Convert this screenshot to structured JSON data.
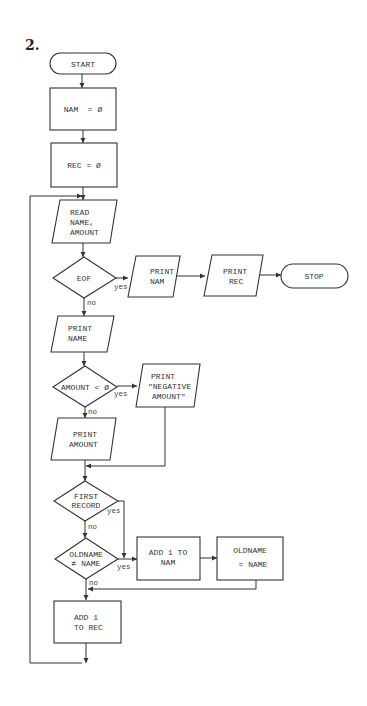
{
  "figure": {
    "number_label": "2."
  },
  "nodes": {
    "start": {
      "type": "terminal",
      "label": "START"
    },
    "init_nam": {
      "type": "process",
      "label": "NAM  = Ø"
    },
    "init_rec": {
      "type": "process",
      "label": "REC = Ø"
    },
    "read": {
      "type": "io",
      "lines": [
        "READ",
        "NAME,",
        "AMOUNT"
      ]
    },
    "eof": {
      "type": "decision",
      "label": "EOF"
    },
    "print_nam": {
      "type": "io",
      "lines": [
        "PRINT",
        "NAM"
      ]
    },
    "print_rec": {
      "type": "io",
      "lines": [
        "PRINT",
        "REC"
      ]
    },
    "stop": {
      "type": "terminal",
      "label": "STOP"
    },
    "print_name": {
      "type": "io",
      "lines": [
        "PRINT",
        "NAME"
      ]
    },
    "amount_neg": {
      "type": "decision",
      "label": "AMOUNT < Ø"
    },
    "print_negative": {
      "type": "io",
      "lines": [
        "PRINT",
        "\"NEGATIVE",
        "AMOUNT\""
      ]
    },
    "print_amount": {
      "type": "io",
      "lines": [
        "PRINT",
        "AMOUNT"
      ]
    },
    "first_record": {
      "type": "decision",
      "lines": [
        "FIRST",
        "RECORD"
      ]
    },
    "oldname_ne": {
      "type": "decision",
      "lines": [
        "OLDNAME",
        "≠ NAME"
      ]
    },
    "add_nam": {
      "type": "process",
      "lines": [
        "ADD 1 TO",
        "NAM"
      ]
    },
    "set_oldname": {
      "type": "process",
      "lines": [
        "OLDNAME",
        "= NAME"
      ]
    },
    "add_rec": {
      "type": "process",
      "lines": [
        "ADD 1",
        "TO REC"
      ]
    }
  },
  "edge_labels": {
    "eof_yes": "yes",
    "eof_no": "no",
    "amount_yes": "yes",
    "amount_no": "no",
    "first_yes": "yes",
    "first_no": "no",
    "oldname_yes": "yes",
    "oldname_no": "no"
  }
}
